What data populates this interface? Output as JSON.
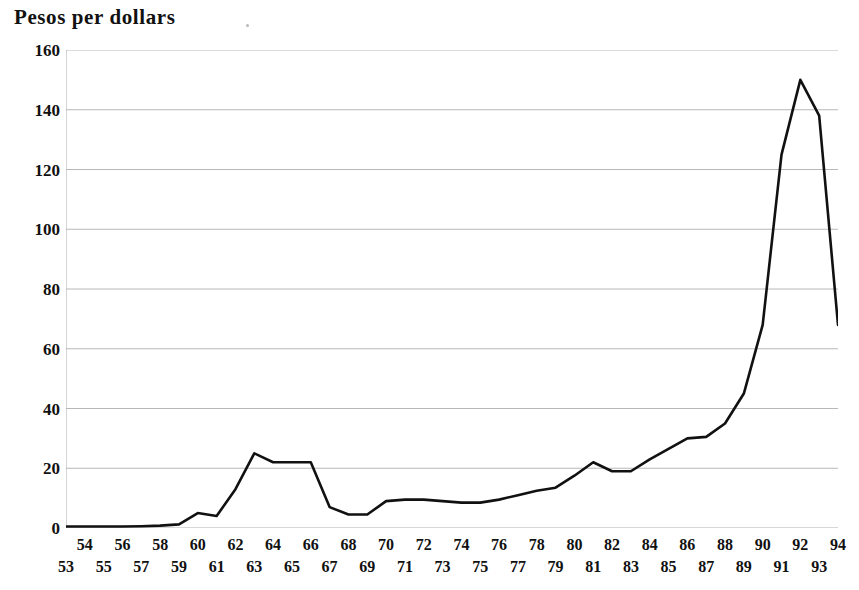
{
  "chart_data": {
    "type": "line",
    "title": "Pesos per dollars",
    "xlabel": "",
    "ylabel": "",
    "xlim": [
      53,
      94
    ],
    "ylim": [
      0,
      160
    ],
    "grid": true,
    "legend": null,
    "y_ticks": [
      160,
      140,
      120,
      100,
      80,
      60,
      40,
      20,
      0
    ],
    "x_ticks": [
      53,
      54,
      55,
      56,
      57,
      58,
      59,
      60,
      61,
      62,
      63,
      64,
      65,
      66,
      67,
      68,
      69,
      70,
      71,
      72,
      73,
      74,
      75,
      76,
      77,
      78,
      79,
      80,
      81,
      82,
      83,
      84,
      85,
      86,
      87,
      88,
      89,
      90,
      91,
      92,
      93,
      94
    ],
    "x": [
      53,
      54,
      55,
      56,
      57,
      58,
      59,
      60,
      61,
      62,
      63,
      64,
      65,
      66,
      67,
      68,
      69,
      70,
      71,
      72,
      73,
      74,
      75,
      76,
      77,
      78,
      79,
      80,
      81,
      82,
      83,
      84,
      85,
      86,
      87,
      88,
      89,
      90,
      91,
      92,
      93,
      94
    ],
    "values": [
      0.5,
      0.5,
      0.5,
      0.5,
      0.6,
      0.8,
      1.2,
      5.0,
      4.0,
      13.0,
      25.0,
      22.0,
      22.0,
      22.0,
      7.0,
      4.5,
      4.5,
      9.0,
      9.5,
      9.5,
      9.0,
      8.5,
      8.5,
      9.5,
      11.0,
      12.5,
      13.5,
      17.5,
      22.0,
      19.0,
      19.0,
      23.0,
      26.5,
      30.0,
      30.5,
      35.0,
      45.0,
      68.0,
      125.0,
      150.0,
      138.0,
      68.0
    ],
    "line_color": "#111111",
    "grid_color": "#b0b0b0",
    "series_name": "Pesos per dollars"
  },
  "axis": {
    "y_labels": [
      "160",
      "140",
      "120",
      "100",
      "80",
      "60",
      "40",
      "20",
      "0"
    ],
    "x_labels_top": [
      "54",
      "56",
      "58",
      "60",
      "62",
      "64",
      "66",
      "68",
      "70",
      "72",
      "74",
      "76",
      "78",
      "80",
      "82",
      "84",
      "86",
      "88",
      "90",
      "92",
      "94"
    ],
    "x_labels_bottom": [
      "53",
      "55",
      "57",
      "59",
      "61",
      "63",
      "65",
      "67",
      "69",
      "71",
      "73",
      "75",
      "77",
      "79",
      "81",
      "83",
      "85",
      "87",
      "89",
      "91",
      "93"
    ]
  }
}
